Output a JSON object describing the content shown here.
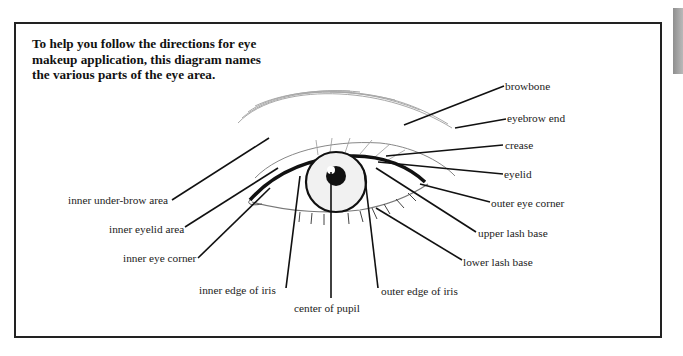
{
  "intro": "To help you follow the directions for eye makeup application, this diagram names the various parts of the eye area.",
  "labels": {
    "browbone": "browbone",
    "eyebrow_end": "eyebrow end",
    "crease": "crease",
    "eyelid": "eyelid",
    "outer_eye_corner": "outer eye corner",
    "upper_lash_base": "upper lash base",
    "lower_lash_base": "lower lash base",
    "outer_edge_of_iris": "outer edge of iris",
    "center_of_pupil": "center of pupil",
    "inner_edge_of_iris": "inner edge of iris",
    "inner_eye_corner": "inner eye corner",
    "inner_eyelid_area": "inner eyelid area",
    "inner_under_brow_area": "inner under-brow area"
  },
  "colors": {
    "ink": "#222222",
    "tab": "#a0a0a0"
  }
}
